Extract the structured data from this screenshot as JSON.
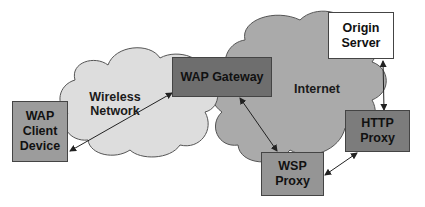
{
  "diagram": {
    "type": "network-architecture",
    "clouds": [
      {
        "id": "wireless",
        "label_line1": "Wireless",
        "label_line2": "Network",
        "color": "#dcdcdc"
      },
      {
        "id": "internet",
        "label": "Internet",
        "color": "#a9a9a9"
      }
    ],
    "nodes": {
      "client": {
        "line1": "WAP",
        "line2": "Client",
        "line3": "Device",
        "color": "#9c9c9c"
      },
      "gateway": {
        "label": "WAP Gateway",
        "color": "#6e6e6e"
      },
      "origin": {
        "line1": "Origin",
        "line2": "Server",
        "color": "#ffffff"
      },
      "http_proxy": {
        "line1": "HTTP",
        "line2": "Proxy",
        "color": "#7c7c7c"
      },
      "wsp_proxy": {
        "line1": "WSP",
        "line2": "Proxy",
        "color": "#959595"
      }
    },
    "edges": [
      {
        "from": "WAP Client Device",
        "to": "WAP Gateway",
        "bidirectional": true
      },
      {
        "from": "WAP Gateway",
        "to": "WSP Proxy",
        "bidirectional": true
      },
      {
        "from": "WSP Proxy",
        "to": "HTTP Proxy",
        "bidirectional": true
      },
      {
        "from": "HTTP Proxy",
        "to": "Origin Server",
        "bidirectional": true
      }
    ]
  }
}
